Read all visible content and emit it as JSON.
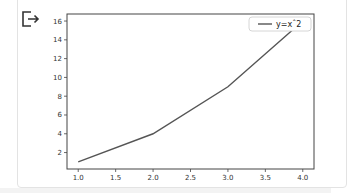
{
  "cell": {
    "output_icon": "output-redirect-icon"
  },
  "chart_data": {
    "type": "line",
    "title": "",
    "xlabel": "",
    "ylabel": "",
    "x": [
      1,
      2,
      3,
      4
    ],
    "series": [
      {
        "name": "y=x^2",
        "values": [
          1,
          4,
          9,
          16
        ],
        "color": "#555555"
      }
    ],
    "xlim": [
      0.85,
      4.15
    ],
    "ylim": [
      0.25,
      16.75
    ],
    "xticks": [
      "1.0",
      "1.5",
      "2.0",
      "2.5",
      "3.0",
      "3.5",
      "4.0"
    ],
    "yticks": [
      "2",
      "4",
      "6",
      "8",
      "10",
      "12",
      "14",
      "16"
    ],
    "grid": false,
    "legend": {
      "position": "upper right",
      "entries": [
        "y=xˆ2"
      ]
    }
  },
  "legend": {
    "label": "y=xˆ2"
  },
  "axes": {
    "xtick_labels": [
      "1.0",
      "1.5",
      "2.0",
      "2.5",
      "3.0",
      "3.5",
      "4.0"
    ],
    "ytick_labels": [
      "2",
      "4",
      "6",
      "8",
      "10",
      "12",
      "14",
      "16"
    ]
  }
}
